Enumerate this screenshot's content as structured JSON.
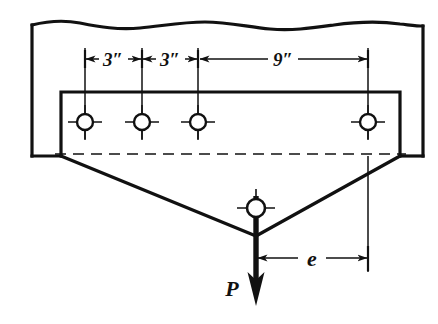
{
  "figure": {
    "colors": {
      "ink": "#111111",
      "background": "#ffffff"
    }
  },
  "dimensions": [
    {
      "id": "dim-3in-a",
      "label": "3″",
      "value": 3,
      "unit": "in",
      "from_x": 85,
      "to_x": 142,
      "text_x": 113,
      "text_y": 66
    },
    {
      "id": "dim-3in-b",
      "label": "3″",
      "value": 3,
      "unit": "in",
      "from_x": 142,
      "to_x": 198,
      "text_x": 170,
      "text_y": 66
    },
    {
      "id": "dim-9in",
      "label": "9″",
      "value": 9,
      "unit": "in",
      "from_x": 198,
      "to_x": 368,
      "text_x": 283,
      "text_y": 66
    }
  ],
  "eccentricity": {
    "id": "dim-e",
    "label": "e",
    "from_x": 256,
    "to_x": 368,
    "text_x": 312,
    "text_y": 266
  },
  "load": {
    "id": "load-P",
    "label": "P",
    "direction": "down",
    "text_x": 232,
    "text_y": 296,
    "tip_x": 256,
    "tip_y": 306
  },
  "rivets": [
    {
      "id": "rivet-1",
      "cx": 85,
      "cy": 122,
      "r": 8
    },
    {
      "id": "rivet-2",
      "cx": 142,
      "cy": 122,
      "r": 8
    },
    {
      "id": "rivet-3",
      "cx": 198,
      "cy": 122,
      "r": 8
    },
    {
      "id": "rivet-4",
      "cx": 368,
      "cy": 122,
      "r": 8
    },
    {
      "id": "rivet-5",
      "cx": 256,
      "cy": 208,
      "r": 9
    }
  ],
  "geometry": {
    "member_left_x": 32,
    "member_right_x": 423,
    "member_bottom_y": 156,
    "member_top_y": 25,
    "gusset_left_x": 61,
    "gusset_right_x": 400,
    "gusset_top_y": 92,
    "centerline_y": 154,
    "apex_x": 256,
    "apex_y": 236
  }
}
